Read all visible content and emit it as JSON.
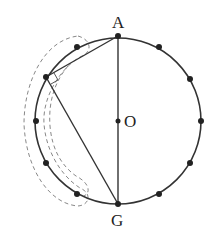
{
  "diagram": {
    "title": "",
    "labels": {
      "top": "A",
      "center": "O",
      "bottom": "G"
    },
    "circle": {
      "cx": 118,
      "cy": 121,
      "r": 83,
      "stroke": "#333333"
    },
    "points_count": 12,
    "colors": {
      "line": "#333333",
      "dashed": "#888888",
      "dot": "#222222"
    }
  }
}
